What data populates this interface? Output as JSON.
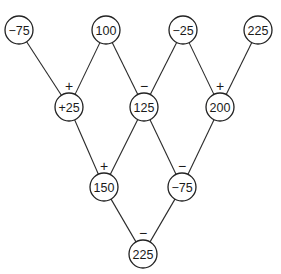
{
  "diagram": {
    "type": "number-pyramid",
    "nodes": [
      {
        "id": "r1c1",
        "label": "−75"
      },
      {
        "id": "r1c2",
        "label": "100"
      },
      {
        "id": "r1c3",
        "label": "−25"
      },
      {
        "id": "r1c4",
        "label": "225"
      },
      {
        "id": "r2c1",
        "label": "+25"
      },
      {
        "id": "r2c2",
        "label": "125"
      },
      {
        "id": "r2c3",
        "label": "200"
      },
      {
        "id": "r3c1",
        "label": "150"
      },
      {
        "id": "r3c2",
        "label": "−75"
      },
      {
        "id": "r4c1",
        "label": "225"
      }
    ],
    "edges": [
      {
        "from": "r1c1",
        "to": "r2c1"
      },
      {
        "from": "r1c2",
        "to": "r2c1"
      },
      {
        "from": "r1c2",
        "to": "r2c2"
      },
      {
        "from": "r1c3",
        "to": "r2c2"
      },
      {
        "from": "r1c3",
        "to": "r2c3"
      },
      {
        "from": "r1c4",
        "to": "r2c3"
      },
      {
        "from": "r2c1",
        "to": "r3c1"
      },
      {
        "from": "r2c2",
        "to": "r3c1"
      },
      {
        "from": "r2c2",
        "to": "r3c2"
      },
      {
        "from": "r2c3",
        "to": "r3c2"
      },
      {
        "from": "r3c1",
        "to": "r4c1"
      },
      {
        "from": "r3c2",
        "to": "r4c1"
      }
    ],
    "operators": [
      {
        "node": "r2c1",
        "symbol": "+"
      },
      {
        "node": "r2c2",
        "symbol": "−"
      },
      {
        "node": "r2c3",
        "symbol": "+"
      },
      {
        "node": "r3c1",
        "symbol": "+"
      },
      {
        "node": "r3c2",
        "symbol": "−"
      },
      {
        "node": "r4c1",
        "symbol": "−"
      }
    ]
  }
}
